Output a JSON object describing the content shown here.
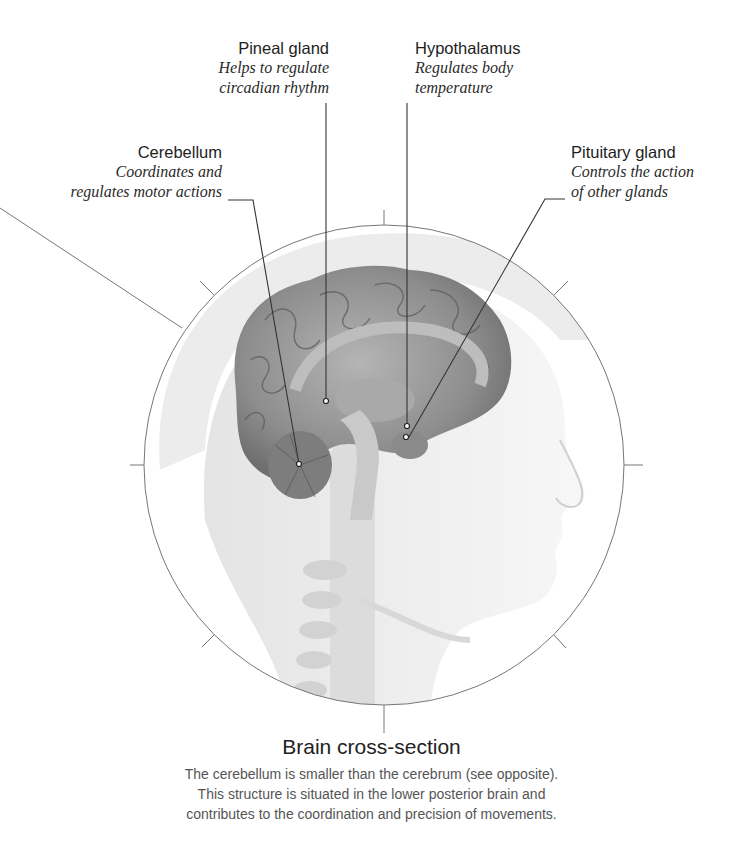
{
  "labels": {
    "pineal": {
      "title": "Pineal gland",
      "desc_line1": "Helps to regulate",
      "desc_line2": "circadian rhythm"
    },
    "hypothalamus": {
      "title": "Hypothalamus",
      "desc_line1": "Regulates body",
      "desc_line2": "temperature"
    },
    "cerebellum": {
      "title": "Cerebellum",
      "desc_line1": "Coordinates and",
      "desc_line2": "regulates motor actions"
    },
    "pituitary": {
      "title": "Pituitary gland",
      "desc_line1": "Controls the action",
      "desc_line2": "of other glands"
    }
  },
  "caption": {
    "title_bold": "Brain",
    "title_rest": " cross-section",
    "line1": "The cerebellum is smaller than the cerebrum (see opposite).",
    "line2": "This structure is situated in the lower posterior brain and",
    "line3": "contributes to the coordination and precision of movements."
  },
  "colors": {
    "line": "#6a6a6a",
    "brain": "#8c8c8c",
    "skin": "#eeeeee"
  }
}
